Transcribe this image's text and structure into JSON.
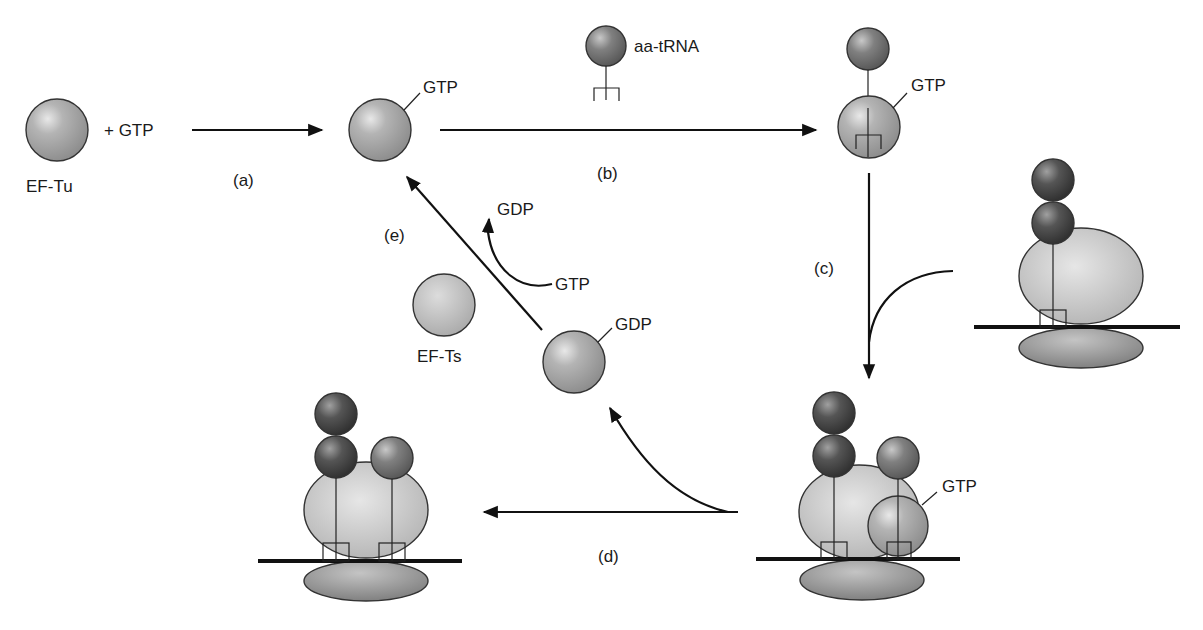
{
  "labels": {
    "ef_tu": "EF-Tu",
    "plus_gtp": "+  GTP",
    "gtp_1": "GTP",
    "aa_trna": "aa-tRNA",
    "gtp_2": "GTP",
    "gdp_bound": "GDP",
    "gdp_released": "GDP",
    "gtp_in": "GTP",
    "ef_ts": "EF-Ts",
    "gtp_ribosome": "GTP"
  },
  "steps": {
    "a": "(a)",
    "b": "(b)",
    "c": "(c)",
    "d": "(d)",
    "e": "(e)"
  },
  "colors": {
    "ef_tu": "#a8a8a8",
    "ef_ts": "#bcbcbc",
    "aa": "#7a7a7a",
    "peptidyl": "#4a4a4a",
    "ribosome_large": "#c2c2c2",
    "ribosome_small": "#8c8c8c",
    "line": "#111111"
  }
}
